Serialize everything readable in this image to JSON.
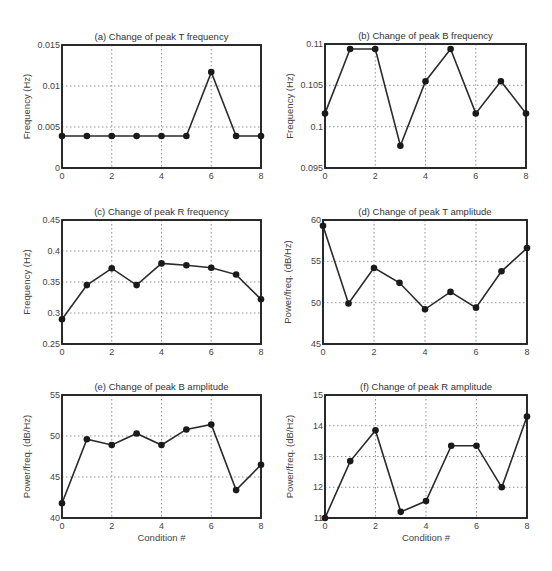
{
  "chart_data": [
    {
      "id": "a",
      "type": "line",
      "title": "(a) Change of peak T frequency",
      "xlabel": "",
      "ylabel": "Frequency (Hz)",
      "x": [
        0,
        1,
        2,
        3,
        4,
        5,
        6,
        7,
        8
      ],
      "values": [
        0.0039,
        0.0039,
        0.0039,
        0.0039,
        0.0039,
        0.0039,
        0.0117,
        0.0039,
        0.0039
      ],
      "xlim": [
        0,
        8
      ],
      "ylim": [
        0,
        0.015
      ],
      "xticks": [
        "0",
        "2",
        "4",
        "6",
        "8"
      ],
      "yticks": [
        "0",
        "0.005",
        "0.01",
        "0.015"
      ],
      "grid": true
    },
    {
      "id": "b",
      "type": "line",
      "title": "(b) Change of peak B frequency",
      "xlabel": "",
      "ylabel": "Frequency (Hz)",
      "x": [
        0,
        1,
        2,
        3,
        4,
        5,
        6,
        7,
        8
      ],
      "values": [
        0.1016,
        0.1094,
        0.1094,
        0.0977,
        0.1055,
        0.1094,
        0.1016,
        0.1055,
        0.1016
      ],
      "xlim": [
        0,
        8
      ],
      "ylim": [
        0.095,
        0.11
      ],
      "xticks": [
        "0",
        "2",
        "4",
        "6",
        "8"
      ],
      "yticks": [
        "0.095",
        "0.1",
        "0.105",
        "0.11"
      ],
      "grid": true
    },
    {
      "id": "c",
      "type": "line",
      "title": "(c) Change of peak R frequency",
      "xlabel": "",
      "ylabel": "Frequency (Hz)",
      "x": [
        0,
        1,
        2,
        3,
        4,
        5,
        6,
        7,
        8
      ],
      "values": [
        0.29,
        0.345,
        0.372,
        0.345,
        0.38,
        0.377,
        0.373,
        0.362,
        0.322
      ],
      "xlim": [
        0,
        8
      ],
      "ylim": [
        0.25,
        0.45
      ],
      "xticks": [
        "0",
        "2",
        "4",
        "6",
        "8"
      ],
      "yticks": [
        "0.25",
        "0.3",
        "0.35",
        "0.4",
        "0.45"
      ],
      "grid": true
    },
    {
      "id": "d",
      "type": "line",
      "title": "(d) Change of peak T amplitude",
      "xlabel": "",
      "ylabel": "Power/freq. (dB/Hz)",
      "x": [
        0,
        1,
        2,
        3,
        4,
        5,
        6,
        7,
        8
      ],
      "values": [
        59.3,
        49.9,
        54.2,
        52.4,
        49.2,
        51.3,
        49.4,
        53.8,
        56.6
      ],
      "xlim": [
        0,
        8
      ],
      "ylim": [
        45,
        60
      ],
      "xticks": [
        "0",
        "2",
        "4",
        "6",
        "8"
      ],
      "yticks": [
        "45",
        "50",
        "55",
        "60"
      ],
      "grid": true
    },
    {
      "id": "e",
      "type": "line",
      "title": "(e) Change of peak B amplitude",
      "xlabel": "Condition #",
      "ylabel": "Power/freq. (dB/Hz)",
      "x": [
        0,
        1,
        2,
        3,
        4,
        5,
        6,
        7,
        8
      ],
      "values": [
        41.8,
        49.6,
        48.9,
        50.3,
        48.9,
        50.8,
        51.4,
        43.4,
        46.5
      ],
      "xlim": [
        0,
        8
      ],
      "ylim": [
        40,
        55
      ],
      "xticks": [
        "0",
        "2",
        "4",
        "6",
        "8"
      ],
      "yticks": [
        "40",
        "45",
        "50",
        "55"
      ],
      "grid": true
    },
    {
      "id": "f",
      "type": "line",
      "title": "(f) Change of peak R amplitude",
      "xlabel": "Condition #",
      "ylabel": "Power/freq. (dB/Hz)",
      "x": [
        0,
        1,
        2,
        3,
        4,
        5,
        6,
        7,
        8
      ],
      "values": [
        11.0,
        12.85,
        13.85,
        11.2,
        11.55,
        13.35,
        13.35,
        12.0,
        14.3
      ],
      "xlim": [
        0,
        8
      ],
      "ylim": [
        11,
        15
      ],
      "xticks": [
        "0",
        "2",
        "4",
        "6",
        "8"
      ],
      "yticks": [
        "11",
        "12",
        "13",
        "14",
        "15"
      ],
      "grid": true
    }
  ],
  "layout": {
    "panels": [
      {
        "left": 62,
        "top": 45,
        "right": 261,
        "bottom": 168
      },
      {
        "left": 325,
        "top": 44,
        "right": 526,
        "bottom": 168
      },
      {
        "left": 62,
        "top": 220,
        "right": 261,
        "bottom": 344
      },
      {
        "left": 323,
        "top": 220,
        "right": 527,
        "bottom": 344
      },
      {
        "left": 62,
        "top": 395,
        "right": 261,
        "bottom": 518
      },
      {
        "left": 325,
        "top": 395,
        "right": 527,
        "bottom": 518
      }
    ],
    "colors": {
      "line": "#2a2a2a",
      "marker": "#1a1a1a",
      "grid": "#777777",
      "frame": "#222222"
    }
  }
}
